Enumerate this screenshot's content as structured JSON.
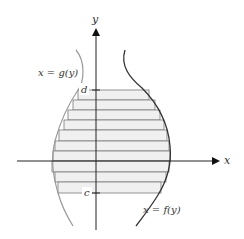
{
  "figure": {
    "axes": {
      "x_label": "x",
      "y_label": "y",
      "origin": {
        "x": 96,
        "y": 161
      }
    },
    "tick_labels": {
      "upper": "d",
      "lower": "c"
    },
    "curves": [
      {
        "id": "g",
        "label": "x = g(y)",
        "color": "#9a9a9a"
      },
      {
        "id": "f",
        "label": "x = f(y)",
        "color": "#333333"
      }
    ],
    "strips": {
      "count": 10,
      "fill": "#f0f0f0",
      "stroke": "#7a7a7a",
      "boundaries_y": [
        90,
        100,
        110,
        120,
        130,
        141,
        151,
        161,
        172,
        182,
        193
      ],
      "left_x": [
        78,
        73,
        68,
        64,
        59,
        55,
        53,
        52,
        55,
        58
      ],
      "right_x": [
        149,
        155,
        160,
        164,
        167,
        169,
        170,
        169,
        166,
        161
      ]
    },
    "colors": {
      "axis": "#222222",
      "region_fill": "#f0f0f0"
    }
  }
}
